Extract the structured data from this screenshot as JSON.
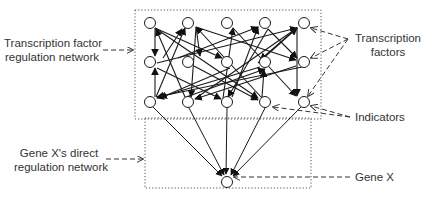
{
  "diagram": {
    "labels": {
      "tf_network": [
        "Transcription factor",
        "regulation network"
      ],
      "direct_network": [
        "Gene X's direct",
        "regulation network"
      ],
      "transcription_factors": [
        "Transcription",
        "factors"
      ],
      "indicators": "Indicators",
      "gene_x": "Gene X"
    },
    "colors": {
      "stroke": "#1a1a1a",
      "text": "#333333",
      "box": "#555555",
      "background": "#ffffff"
    },
    "nodes": {
      "rows": [
        {
          "role": "transcription-factors",
          "y": 23,
          "x": [
            150,
            188,
            227,
            265,
            304
          ]
        },
        {
          "role": "transcription-factors",
          "y": 62,
          "x": [
            150,
            188,
            227,
            265,
            304
          ]
        },
        {
          "role": "indicators",
          "y": 102,
          "x": [
            150,
            188,
            227,
            265,
            304
          ]
        }
      ],
      "gene_x": {
        "x": 227,
        "y": 182
      },
      "radius": 5.5
    },
    "boxes": [
      {
        "name": "tf-regulation-network-box",
        "x": 135,
        "y": 10,
        "w": 186,
        "h": 109
      },
      {
        "name": "direct-regulation-network-box",
        "x": 145,
        "y": 118,
        "w": 166,
        "h": 70
      }
    ]
  }
}
